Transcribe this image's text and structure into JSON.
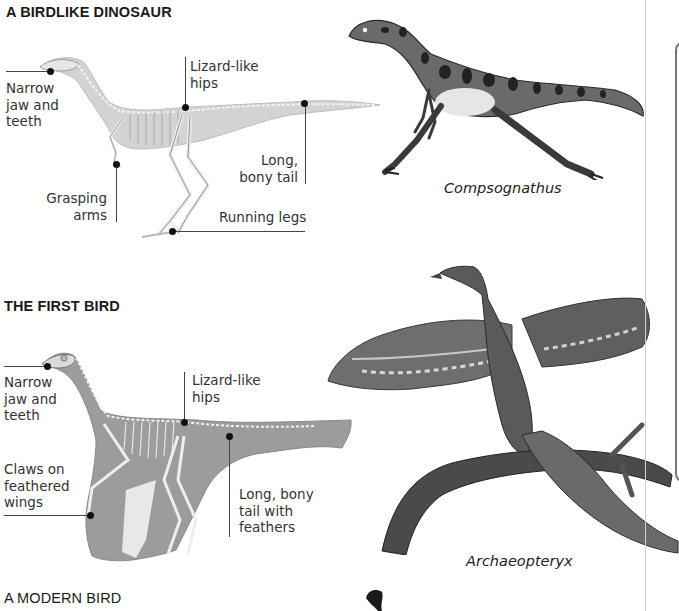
{
  "sections": [
    {
      "title": "A BIRDLIKE DINOSAUR",
      "labels": {
        "jaw": [
          "Narrow",
          "jaw and",
          "teeth"
        ],
        "hips": [
          "Lizard-like",
          "hips"
        ],
        "tail": [
          "Long,",
          "bony tail"
        ],
        "arms": [
          "Grasping",
          "arms"
        ],
        "legs": "Running legs"
      },
      "caption": "Compsognathus"
    },
    {
      "title": "THE FIRST BIRD",
      "labels": {
        "jaw": [
          "Narrow",
          "jaw and",
          "teeth"
        ],
        "hips": [
          "Lizard-like",
          "hips"
        ],
        "claws": [
          "Claws on",
          "feathered",
          "wings"
        ],
        "tail": [
          "Long, bony",
          "tail with",
          "feathers"
        ]
      },
      "caption": "Archaeopteryx"
    },
    {
      "title": "A MODERN BIRD"
    }
  ],
  "icons": {
    "skeleton_fill": "#d2d2d2",
    "first_bird_fill": "#9a9a9a",
    "ink": "#2a2a2a"
  }
}
